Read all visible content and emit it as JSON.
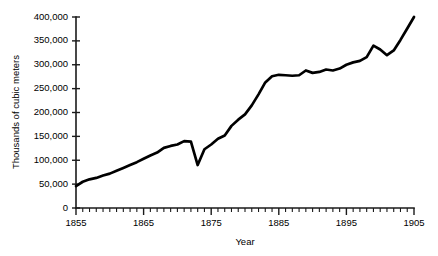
{
  "chart_data": {
    "type": "line",
    "title": "",
    "xlabel": "Year",
    "ylabel": "Thousands of cubic meters",
    "xlim": [
      1855,
      1905
    ],
    "ylim": [
      0,
      400000
    ],
    "grid": false,
    "legend": null,
    "y_ticks": [
      0,
      50000,
      100000,
      150000,
      200000,
      250000,
      300000,
      350000,
      400000
    ],
    "y_tick_labels": [
      "0",
      "50,000",
      "100,000",
      "150,000",
      "200,000",
      "250,000",
      "300,000",
      "350,000",
      "400,000"
    ],
    "x_ticks": [
      1855,
      1865,
      1875,
      1885,
      1895,
      1905
    ],
    "x_tick_labels": [
      "1855",
      "1865",
      "1875",
      "1885",
      "1895",
      "1905"
    ],
    "x_minor_tick_step": 1,
    "line_color": "#000000",
    "series": [
      {
        "name": "Production",
        "x": [
          1855,
          1856,
          1857,
          1858,
          1859,
          1860,
          1861,
          1862,
          1863,
          1864,
          1865,
          1866,
          1867,
          1868,
          1869,
          1870,
          1871,
          1872,
          1873,
          1874,
          1875,
          1876,
          1877,
          1878,
          1879,
          1880,
          1881,
          1882,
          1883,
          1884,
          1885,
          1886,
          1887,
          1888,
          1889,
          1890,
          1891,
          1892,
          1893,
          1894,
          1895,
          1896,
          1897,
          1898,
          1899,
          1900,
          1901,
          1902,
          1903,
          1904,
          1905
        ],
        "values": [
          46000,
          55000,
          60000,
          63000,
          68000,
          72000,
          78000,
          84000,
          90000,
          96000,
          103000,
          110000,
          116000,
          126000,
          130000,
          133000,
          140000,
          139000,
          90000,
          123000,
          133000,
          145000,
          152000,
          172000,
          185000,
          196000,
          215000,
          238000,
          263000,
          276000,
          279000,
          278000,
          277000,
          278000,
          288000,
          283000,
          285000,
          290000,
          288000,
          292000,
          300000,
          305000,
          308000,
          316000,
          340000,
          332000,
          320000,
          330000,
          352000,
          376000,
          400000
        ]
      }
    ]
  }
}
